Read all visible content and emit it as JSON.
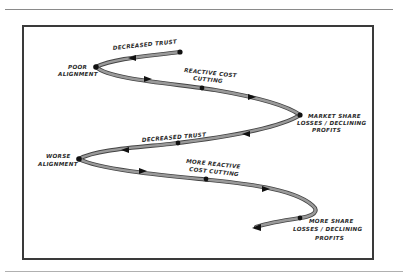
{
  "diagram": {
    "type": "spiral-flow",
    "colors": {
      "path": "#8c8c8c",
      "path_outline": "#444444",
      "marker": "#111111",
      "frame": "#3a3a3a",
      "rule": "#8a8a8a"
    },
    "labels": {
      "decreased_trust_1": "DECREASED TRUST",
      "poor_alignment_1": "POOR",
      "poor_alignment_2": "ALIGNMENT",
      "reactive_cost_1": "REACTIVE COST",
      "reactive_cost_2": "CUTTING",
      "market_share_1": "MARKET SHARE",
      "market_share_2": "LOSSES / DECLINING",
      "market_share_3": "PROFITS",
      "decreased_trust_2": "DECREASED TRUST",
      "worse_alignment_1": "WORSE",
      "worse_alignment_2": "ALIGNMENT",
      "more_reactive_1": "MORE REACTIVE",
      "more_reactive_2": "COST CUTTING",
      "more_share_1": "MORE SHARE",
      "more_share_2": "LOSSES / DECLINING",
      "more_share_3": "PROFITS"
    }
  }
}
